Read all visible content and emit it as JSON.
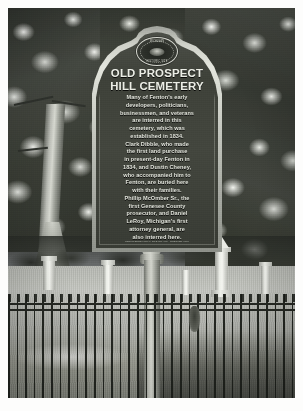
{
  "photo": {
    "description": "Black and white photograph of a Michigan historical marker in a cemetery",
    "border_color": "#fdfdfc"
  },
  "marker": {
    "seal": {
      "icon": "state-seal-icon",
      "text_top": "MICHIGAN",
      "text_bottom": "HISTORIC SITE"
    },
    "title_line_1": "OLD PROSPECT",
    "title_line_2": "HILL CEMETERY",
    "body_lines": [
      "Many of Fenton's early",
      "developers, politicians,",
      "businessmen, and veterans",
      "are interred in this",
      "cemetery, which was",
      "established in 1834.",
      "Clark Dibble, who made",
      "the first land purchase",
      "in present-day Fenton in",
      "1834, and Dustin Cheney,",
      "who accompanied him to",
      "Fenton, are buried here",
      "with their families.",
      "Phillip McOmber Sr., the",
      "first Genesee County",
      "prosecutor, and Daniel",
      "LeRoy, Michigan's first",
      "attorney general, are",
      "also interred here."
    ],
    "fineprint": "REGISTERED LOCAL SITE NO. 000 · ERECTED 0000",
    "board_color": "#3e4139",
    "text_color": "#e2e4dc",
    "frame_color": "#d5d7cf"
  },
  "scene": {
    "sky_color": "#a9aeb3",
    "lawn_color": "#b6b8b2",
    "fence_color": "#1c1f1a",
    "monument_color": "#eceee8",
    "elements": [
      "tree-left",
      "tree-right",
      "treeline",
      "lawn",
      "iron-fence",
      "obelisk-monument",
      "headstones",
      "marker-post"
    ]
  }
}
